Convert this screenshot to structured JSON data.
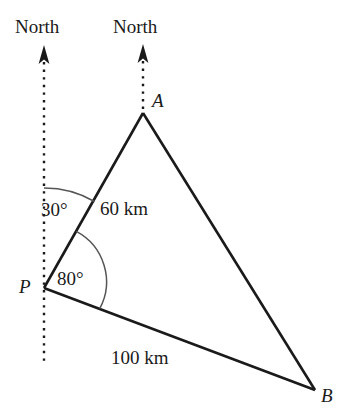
{
  "diagram": {
    "type": "geometry-bearing-triangle",
    "stroke_color": "#1a1a1a",
    "arc_color": "#555555",
    "background_color": "#ffffff",
    "labels": {
      "north_left": "North",
      "north_right": "North",
      "point_a": "A",
      "point_p": "P",
      "point_b": "B",
      "angle_at_p_from_north": "30°",
      "angle_apb": "80°",
      "side_pa": "60 km",
      "side_pb": "100 km"
    },
    "vertices": {
      "A": {
        "x": 143,
        "y": 113
      },
      "P": {
        "x": 44,
        "y": 288
      },
      "B": {
        "x": 315,
        "y": 390
      }
    },
    "north_arrows": [
      {
        "name": "north-arrow-left",
        "tip_x": 44,
        "tip_y": 47,
        "base_y": 365
      },
      {
        "name": "north-arrow-right",
        "tip_x": 143,
        "tip_y": 46,
        "base_y": 113
      }
    ],
    "measurements": {
      "bearing_of_a_from_p_deg": 30,
      "angle_apb_deg": 80,
      "length_pa_km": 60,
      "length_pb_km": 100,
      "length_unit": "km"
    }
  }
}
